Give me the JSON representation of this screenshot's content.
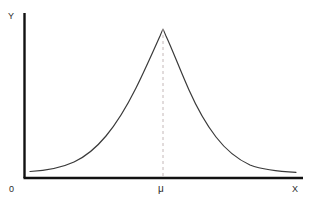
{
  "figure": {
    "type": "statistical-plot",
    "background_color": "#ffffff",
    "width": 311,
    "height": 202
  },
  "axes": {
    "y_axis": {
      "label": "Y",
      "color": "#111111",
      "x_px": 24,
      "y_top_px": 13,
      "y_bottom_px": 178,
      "thickness_px": 2.4
    },
    "x_axis": {
      "label": "X",
      "color": "#111111",
      "y_px": 178,
      "x_left_px": 24,
      "x_right_px": 303,
      "thickness_px": 2.6
    },
    "origin": {
      "label": "0"
    },
    "tick_labels": {
      "mean": "μ"
    }
  },
  "curve": {
    "name": "normal-distribution-curve",
    "color": "#3a3a3a",
    "stroke_width_px": 1.2,
    "fill": "none",
    "peak_x_px": 163,
    "peak_y_px": 29,
    "baseline_y_px": 172
  },
  "mean_marker": {
    "name": "mean-dashed-line",
    "color": "#c4b8b8",
    "stroke_width_px": 1,
    "dash_pattern": "3 3",
    "x_px": 163,
    "y_top_px": 29,
    "y_bottom_px": 178,
    "label": "μ"
  },
  "chart_data": {
    "type": "line",
    "title": "",
    "xlabel": "X",
    "ylabel": "Y",
    "grid": false,
    "legend": null,
    "annotations": [
      {
        "text": "μ",
        "x": 163,
        "y": 189,
        "role": "mean-tick-label"
      },
      {
        "text": "0",
        "x": 12,
        "y": 189,
        "role": "origin-label"
      },
      {
        "text": "Y",
        "x": 12,
        "y": 16,
        "role": "y-axis-label"
      },
      {
        "text": "X",
        "x": 296,
        "y": 189,
        "role": "x-axis-label"
      }
    ],
    "axis_ranges": {
      "xlim": [
        24,
        303
      ],
      "ylim": [
        178,
        29
      ]
    },
    "series": [
      {
        "name": "normal-pdf",
        "x": [
          30,
          40,
          50,
          60,
          70,
          80,
          90,
          100,
          110,
          120,
          130,
          140,
          150,
          163,
          175,
          185,
          195,
          205,
          215,
          225,
          235,
          245,
          255,
          265,
          275,
          285,
          296
        ],
        "y": [
          171,
          170,
          168,
          165,
          161,
          155,
          147,
          136,
          122,
          106,
          88,
          68,
          48,
          29,
          37,
          51,
          68,
          88,
          108,
          126,
          141,
          152,
          160,
          165,
          169,
          171,
          172
        ]
      }
    ]
  }
}
